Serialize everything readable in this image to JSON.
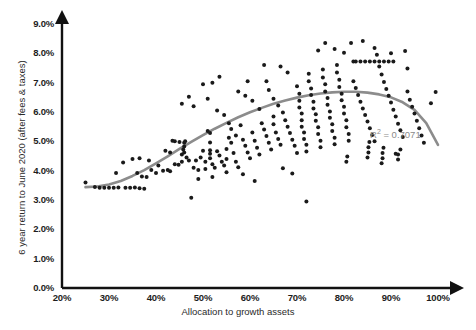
{
  "chart_data": {
    "type": "scatter",
    "title": "",
    "xlabel": "Allocation to growth assets",
    "ylabel": "6 year return to June 2020 (after fees & taxes)",
    "xlim": [
      20,
      100
    ],
    "ylim": [
      0,
      9
    ],
    "x_tick_labels": [
      "20%",
      "30%",
      "40%",
      "50%",
      "60%",
      "70%",
      "80%",
      "90%",
      "100%"
    ],
    "x_ticks": [
      20,
      30,
      40,
      50,
      60,
      70,
      80,
      90,
      100
    ],
    "y_tick_labels": [
      "0.0%",
      "1.0%",
      "2.0%",
      "3.0%",
      "4.0%",
      "5.0%",
      "6.0%",
      "7.0%",
      "8.0%",
      "9.0%"
    ],
    "y_ticks": [
      0,
      1,
      2,
      3,
      4,
      5,
      6,
      7,
      8,
      9
    ],
    "grid": false,
    "legend": "none",
    "annotations": [
      {
        "name": "r-squared",
        "text_prefix": "R",
        "text_sup": "2",
        "text_suffix": " = 0.7071",
        "full_text": "R2 = 0.7071",
        "x": 88.5,
        "y": 5.45,
        "color": "#8a8a8a"
      }
    ],
    "point_color": "#1a1a1a",
    "point_radius_px": 2.0,
    "trendline": {
      "name": "polynomial-trendline",
      "type": "quadratic",
      "color": "#8c8c8c",
      "width_px": 2.6,
      "r_squared": 0.7071,
      "points": [
        [
          25.0,
          3.44
        ],
        [
          27.5,
          3.46
        ],
        [
          30.0,
          3.53
        ],
        [
          32.5,
          3.65
        ],
        [
          35.0,
          3.82
        ],
        [
          37.5,
          4.02
        ],
        [
          40.0,
          4.25
        ],
        [
          42.5,
          4.49
        ],
        [
          45.0,
          4.74
        ],
        [
          47.5,
          4.98
        ],
        [
          50.0,
          5.21
        ],
        [
          52.5,
          5.43
        ],
        [
          55.0,
          5.63
        ],
        [
          57.5,
          5.82
        ],
        [
          60.0,
          5.99
        ],
        [
          62.5,
          6.14
        ],
        [
          65.0,
          6.28
        ],
        [
          67.5,
          6.39
        ],
        [
          70.0,
          6.49
        ],
        [
          72.5,
          6.57
        ],
        [
          75.0,
          6.63
        ],
        [
          77.5,
          6.67
        ],
        [
          80.0,
          6.69
        ],
        [
          82.5,
          6.69
        ],
        [
          85.0,
          6.66
        ],
        [
          87.5,
          6.6
        ],
        [
          90.0,
          6.5
        ],
        [
          92.5,
          6.33
        ],
        [
          95.0,
          6.07
        ],
        [
          97.5,
          5.62
        ],
        [
          100.0,
          4.88
        ]
      ]
    },
    "series": [
      {
        "name": "funds",
        "point_count": 224,
        "points": [
          [
            25.0,
            3.6
          ],
          [
            27.0,
            3.44
          ],
          [
            28.0,
            3.42
          ],
          [
            29.0,
            3.42
          ],
          [
            30.0,
            3.42
          ],
          [
            31.0,
            3.42
          ],
          [
            32.0,
            3.43
          ],
          [
            33.5,
            3.42
          ],
          [
            34.5,
            3.42
          ],
          [
            35.5,
            3.43
          ],
          [
            36.5,
            3.4
          ],
          [
            37.5,
            3.38
          ],
          [
            35.0,
            4.4
          ],
          [
            36.0,
            3.92
          ],
          [
            37.0,
            3.8
          ],
          [
            38.0,
            3.78
          ],
          [
            39.0,
            4.02
          ],
          [
            40.0,
            3.92
          ],
          [
            40.5,
            4.18
          ],
          [
            41.5,
            4.0
          ],
          [
            42.5,
            4.02
          ],
          [
            43.0,
            3.98
          ],
          [
            44.0,
            4.22
          ],
          [
            44.8,
            4.2
          ],
          [
            45.5,
            4.55
          ],
          [
            45.5,
            4.3
          ],
          [
            45.8,
            4.72
          ],
          [
            46.0,
            4.95
          ],
          [
            46.0,
            4.82
          ],
          [
            46.0,
            4.62
          ],
          [
            46.2,
            5.0
          ],
          [
            46.5,
            4.45
          ],
          [
            47.0,
            4.35
          ],
          [
            44.0,
            5.0
          ],
          [
            45.0,
            4.98
          ],
          [
            43.5,
            5.02
          ],
          [
            47.5,
            3.08
          ],
          [
            48.0,
            4.1
          ],
          [
            48.5,
            4.35
          ],
          [
            49.0,
            4.02
          ],
          [
            49.5,
            4.45
          ],
          [
            50.0,
            4.68
          ],
          [
            50.5,
            4.3
          ],
          [
            50.5,
            4.06
          ],
          [
            51.0,
            5.35
          ],
          [
            51.5,
            5.28
          ],
          [
            51.5,
            4.96
          ],
          [
            51.5,
            4.7
          ],
          [
            51.5,
            4.58
          ],
          [
            51.5,
            4.42
          ],
          [
            52.0,
            4.22
          ],
          [
            52.5,
            4.1
          ],
          [
            53.0,
            4.66
          ],
          [
            53.5,
            4.52
          ],
          [
            54.0,
            4.3
          ],
          [
            54.5,
            4.18
          ],
          [
            55.0,
            4.74
          ],
          [
            55.0,
            4.4
          ],
          [
            55.5,
            5.12
          ],
          [
            56.0,
            4.95
          ],
          [
            56.5,
            4.6
          ],
          [
            57.0,
            4.3
          ],
          [
            57.5,
            4.12
          ],
          [
            48.0,
            6.2
          ],
          [
            50.0,
            6.95
          ],
          [
            52.0,
            7.0
          ],
          [
            53.0,
            6.05
          ],
          [
            54.5,
            5.9
          ],
          [
            55.5,
            5.62
          ],
          [
            56.0,
            5.42
          ],
          [
            57.0,
            5.2
          ],
          [
            58.0,
            5.55
          ],
          [
            58.5,
            5.05
          ],
          [
            59.0,
            4.85
          ],
          [
            59.5,
            4.62
          ],
          [
            60.0,
            4.42
          ],
          [
            60.5,
            5.3
          ],
          [
            61.0,
            5.02
          ],
          [
            61.5,
            4.78
          ],
          [
            62.0,
            4.55
          ],
          [
            62.5,
            5.62
          ],
          [
            63.0,
            5.4
          ],
          [
            63.5,
            5.18
          ],
          [
            64.0,
            4.95
          ],
          [
            64.5,
            4.72
          ],
          [
            65.0,
            5.85
          ],
          [
            65.0,
            5.58
          ],
          [
            65.5,
            5.3
          ],
          [
            66.0,
            5.08
          ],
          [
            66.5,
            4.88
          ],
          [
            59.0,
            6.55
          ],
          [
            60.5,
            6.38
          ],
          [
            62.0,
            6.1
          ],
          [
            63.5,
            7.05
          ],
          [
            64.0,
            6.75
          ],
          [
            65.0,
            6.45
          ],
          [
            66.0,
            6.22
          ],
          [
            67.0,
            5.98
          ],
          [
            67.5,
            5.72
          ],
          [
            68.0,
            5.5
          ],
          [
            68.5,
            5.28
          ],
          [
            69.0,
            5.05
          ],
          [
            69.5,
            4.85
          ],
          [
            70.0,
            4.6
          ],
          [
            70.0,
            6.88
          ],
          [
            70.5,
            6.62
          ],
          [
            70.5,
            6.38
          ],
          [
            70.5,
            6.15
          ],
          [
            71.0,
            5.95
          ],
          [
            71.0,
            5.72
          ],
          [
            71.0,
            5.5
          ],
          [
            71.5,
            5.3
          ],
          [
            71.5,
            5.08
          ],
          [
            72.0,
            4.88
          ],
          [
            72.0,
            4.65
          ],
          [
            72.5,
            7.3
          ],
          [
            72.5,
            7.05
          ],
          [
            73.0,
            6.8
          ],
          [
            73.0,
            6.58
          ],
          [
            73.5,
            6.35
          ],
          [
            73.5,
            6.12
          ],
          [
            74.0,
            5.92
          ],
          [
            74.0,
            5.7
          ],
          [
            74.5,
            5.48
          ],
          [
            74.5,
            5.25
          ],
          [
            75.0,
            5.02
          ],
          [
            75.0,
            4.8
          ],
          [
            75.5,
            7.45
          ],
          [
            75.5,
            7.18
          ],
          [
            76.0,
            6.95
          ],
          [
            76.0,
            6.7
          ],
          [
            76.5,
            6.48
          ],
          [
            76.5,
            6.25
          ],
          [
            77.0,
            6.02
          ],
          [
            77.0,
            5.8
          ],
          [
            77.5,
            5.58
          ],
          [
            77.5,
            5.35
          ],
          [
            78.0,
            5.12
          ],
          [
            78.0,
            4.9
          ],
          [
            78.5,
            7.6
          ],
          [
            78.5,
            7.35
          ],
          [
            79.0,
            7.1
          ],
          [
            79.0,
            6.85
          ],
          [
            79.5,
            6.62
          ],
          [
            79.5,
            6.4
          ],
          [
            80.0,
            6.18
          ],
          [
            80.0,
            5.95
          ],
          [
            80.5,
            5.72
          ],
          [
            80.5,
            5.48
          ],
          [
            81.0,
            5.25
          ],
          [
            81.0,
            5.02
          ],
          [
            81.5,
            8.35
          ],
          [
            82.0,
            7.72
          ],
          [
            82.5,
            7.72
          ],
          [
            83.5,
            7.72
          ],
          [
            84.5,
            7.72
          ],
          [
            85.5,
            7.72
          ],
          [
            86.5,
            7.72
          ],
          [
            87.5,
            7.72
          ],
          [
            88.5,
            7.72
          ],
          [
            89.5,
            7.72
          ],
          [
            90.5,
            7.72
          ],
          [
            82.0,
            7.05
          ],
          [
            82.5,
            6.82
          ],
          [
            83.0,
            6.58
          ],
          [
            83.5,
            6.35
          ],
          [
            84.0,
            6.12
          ],
          [
            84.5,
            5.9
          ],
          [
            85.0,
            5.68
          ],
          [
            85.5,
            5.45
          ],
          [
            86.0,
            5.22
          ],
          [
            86.5,
            5.0
          ],
          [
            87.0,
            7.95
          ],
          [
            87.5,
            7.55
          ],
          [
            88.0,
            7.28
          ],
          [
            88.5,
            7.02
          ],
          [
            89.0,
            6.78
          ],
          [
            89.5,
            6.55
          ],
          [
            90.0,
            6.32
          ],
          [
            90.5,
            6.08
          ],
          [
            91.0,
            5.85
          ],
          [
            91.5,
            5.6
          ],
          [
            92.0,
            5.38
          ],
          [
            92.5,
            5.15
          ],
          [
            93.0,
            8.08
          ],
          [
            93.5,
            7.48
          ],
          [
            93.5,
            6.7
          ],
          [
            94.0,
            6.42
          ],
          [
            94.5,
            6.18
          ],
          [
            95.0,
            5.95
          ],
          [
            95.5,
            5.7
          ],
          [
            96.0,
            5.45
          ],
          [
            96.5,
            5.2
          ],
          [
            97.0,
            4.95
          ],
          [
            98.5,
            6.3
          ],
          [
            99.5,
            6.68
          ],
          [
            91.0,
            4.58
          ],
          [
            91.5,
            4.55
          ],
          [
            91.5,
            4.38
          ],
          [
            92.0,
            4.72
          ],
          [
            88.0,
            4.25
          ],
          [
            88.2,
            4.42
          ],
          [
            88.2,
            4.6
          ],
          [
            88.4,
            4.78
          ],
          [
            85.0,
            4.45
          ],
          [
            85.2,
            4.62
          ],
          [
            85.2,
            4.8
          ],
          [
            85.4,
            4.98
          ],
          [
            80.5,
            4.3
          ],
          [
            80.7,
            4.48
          ],
          [
            68.0,
            7.35
          ],
          [
            66.5,
            7.55
          ],
          [
            63.0,
            7.6
          ],
          [
            59.5,
            7.05
          ],
          [
            57.5,
            6.7
          ],
          [
            74.5,
            8.1
          ],
          [
            78.0,
            8.15
          ],
          [
            80.0,
            8.02
          ],
          [
            86.5,
            8.18
          ],
          [
            90.0,
            8.0
          ],
          [
            61.0,
            3.65
          ],
          [
            72.0,
            2.95
          ],
          [
            67.0,
            4.08
          ],
          [
            69.0,
            3.9
          ],
          [
            42.0,
            4.68
          ],
          [
            43.0,
            4.62
          ],
          [
            38.5,
            4.35
          ],
          [
            36.5,
            4.42
          ],
          [
            33.0,
            4.28
          ],
          [
            31.5,
            3.92
          ],
          [
            55.0,
            3.95
          ],
          [
            58.5,
            3.88
          ],
          [
            52.0,
            3.78
          ],
          [
            49.0,
            3.72
          ],
          [
            47.0,
            6.52
          ],
          [
            45.5,
            6.28
          ],
          [
            53.5,
            7.2
          ],
          [
            51.0,
            6.45
          ],
          [
            84.0,
            8.42
          ],
          [
            76.0,
            8.35
          ]
        ]
      }
    ]
  },
  "axis_style": {
    "axis_color": "#111111",
    "axis_width_px": 2.4,
    "arrow_heads": true
  }
}
